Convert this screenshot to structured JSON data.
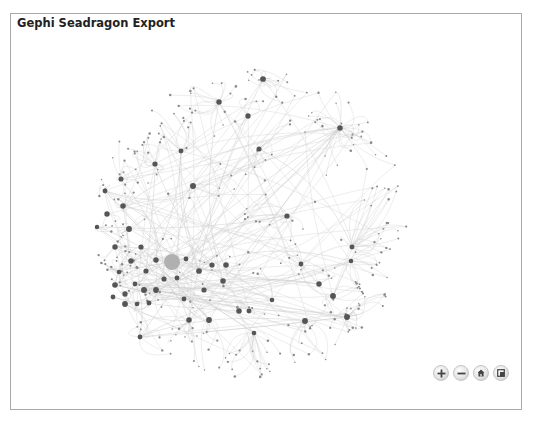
{
  "app": {
    "title": "Gephi Seadragon Export"
  },
  "viewer": {
    "description": "Network graph (circular layout) rendered in a Seadragon deep-zoom viewer",
    "node_color": "#555555",
    "hub_color": "#b0b0b0",
    "edge_color": "#cfcfcf"
  },
  "controls": [
    {
      "id": "zoom-in",
      "icon": "plus-icon",
      "label": "Zoom in"
    },
    {
      "id": "zoom-out",
      "icon": "minus-icon",
      "label": "Zoom out"
    },
    {
      "id": "home",
      "icon": "home-icon",
      "label": "Go home"
    },
    {
      "id": "fullscreen",
      "icon": "fullscreen-icon",
      "label": "Toggle full page"
    }
  ]
}
